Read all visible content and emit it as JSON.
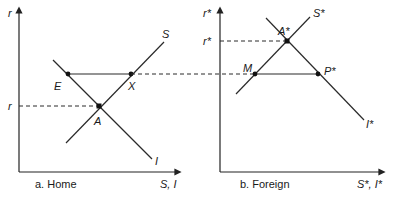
{
  "panels": {
    "home": {
      "caption": "a. Home",
      "y_axis_label": "r",
      "x_axis_label": "S, I",
      "rate_tick_label": "r",
      "curves": {
        "saving": "S",
        "investment": "I"
      },
      "points": {
        "E": "E",
        "X": "X",
        "A": "A"
      }
    },
    "foreign": {
      "caption": "b. Foreign",
      "y_axis_label": "r*",
      "x_axis_label": "S*, I*",
      "rate_tick_label": "r*",
      "curves": {
        "saving": "S*",
        "investment": "I*"
      },
      "points": {
        "M": "M",
        "P": "P*",
        "A": "A*"
      }
    }
  },
  "colors": {
    "ink": "#222222",
    "background": "#ffffff"
  }
}
